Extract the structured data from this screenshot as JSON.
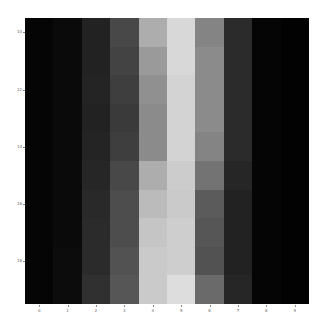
{
  "chart_data": {
    "type": "heatmap",
    "title": "",
    "xlabel": "",
    "ylabel": "",
    "colormap": "gray",
    "x_ticks": [
      "0",
      "1",
      "2",
      "3",
      "4",
      "5",
      "6",
      "7",
      "8",
      "9"
    ],
    "y_ticks": [
      "10",
      "11",
      "12",
      "13",
      "14",
      "15",
      "16",
      "17",
      "18",
      "19"
    ],
    "grid": false,
    "values": [
      [
        2,
        4,
        14,
        30,
        72,
        90,
        55,
        18,
        2,
        1
      ],
      [
        2,
        4,
        14,
        28,
        64,
        90,
        58,
        18,
        2,
        1
      ],
      [
        2,
        4,
        15,
        26,
        60,
        88,
        58,
        18,
        2,
        1
      ],
      [
        2,
        4,
        14,
        24,
        58,
        88,
        58,
        18,
        2,
        1
      ],
      [
        2,
        4,
        15,
        26,
        58,
        88,
        55,
        18,
        2,
        1
      ],
      [
        2,
        4,
        16,
        30,
        72,
        85,
        48,
        16,
        2,
        1
      ],
      [
        2,
        4,
        17,
        32,
        78,
        84,
        38,
        14,
        2,
        1
      ],
      [
        2,
        4,
        18,
        32,
        82,
        86,
        36,
        14,
        2,
        1
      ],
      [
        2,
        5,
        18,
        34,
        84,
        86,
        34,
        14,
        2,
        1
      ],
      [
        2,
        5,
        20,
        36,
        84,
        92,
        44,
        16,
        2,
        1
      ]
    ],
    "value_range": [
      0,
      100
    ]
  }
}
